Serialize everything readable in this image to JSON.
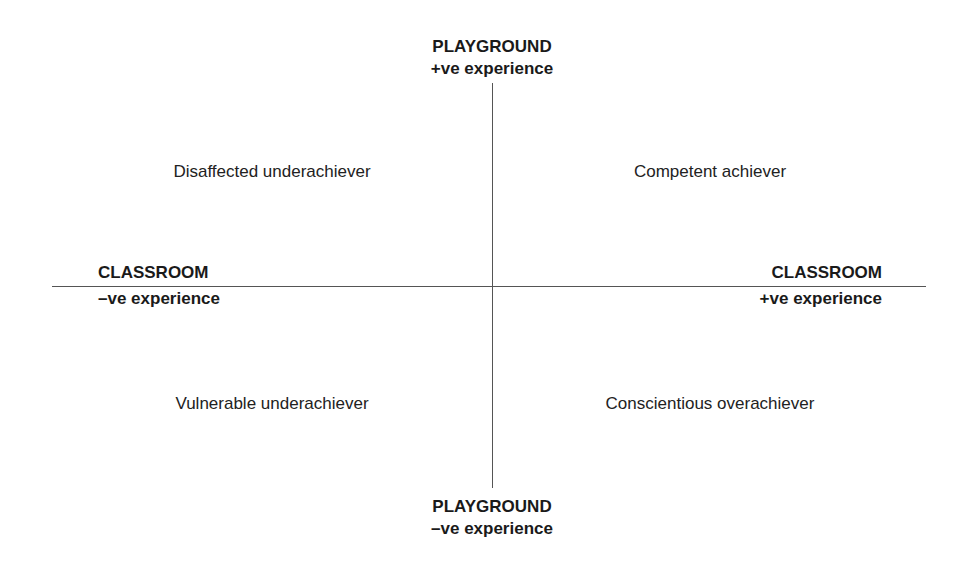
{
  "axes": {
    "top": {
      "title": "PLAYGROUND",
      "subtitle": "+ve experience"
    },
    "bottom": {
      "title": "PLAYGROUND",
      "subtitle": "–ve experience"
    },
    "left": {
      "title": "CLASSROOM",
      "subtitle": "–ve experience"
    },
    "right": {
      "title": "CLASSROOM",
      "subtitle": "+ve experience"
    }
  },
  "quadrants": {
    "top_left": "Disaffected underachiever",
    "top_right": "Competent achiever",
    "bottom_left": "Vulnerable underachiever",
    "bottom_right": "Conscientious overachiever"
  }
}
